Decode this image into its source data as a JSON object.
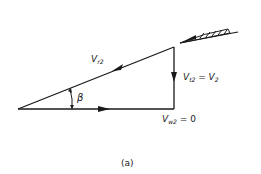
{
  "diagram": {
    "caption": "(a)",
    "labels": {
      "relative_velocity": {
        "main": "V",
        "sub": "r2"
      },
      "tangential_velocity": {
        "main": "V",
        "sub": "t2",
        "eq": " = ",
        "rhs_main": "V",
        "rhs_sub": "2"
      },
      "whirl_velocity": {
        "main": "V",
        "sub": "w2",
        "eq": " = 0"
      },
      "angle": "β"
    },
    "colors": {
      "stroke": "#1a1a1a",
      "background": "#ffffff"
    }
  }
}
